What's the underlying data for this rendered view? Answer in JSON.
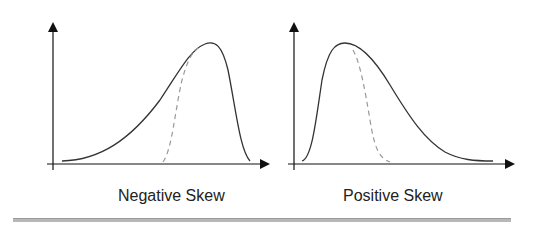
{
  "panels": [
    {
      "label": "Negative Skew",
      "skew": "negative",
      "curve_color": "#333333",
      "dashed_color": "#999999"
    },
    {
      "label": "Positive Skew",
      "skew": "positive",
      "curve_color": "#333333",
      "dashed_color": "#999999"
    }
  ],
  "colors": {
    "axis": "#111111",
    "rule": "#b8b8b8"
  }
}
